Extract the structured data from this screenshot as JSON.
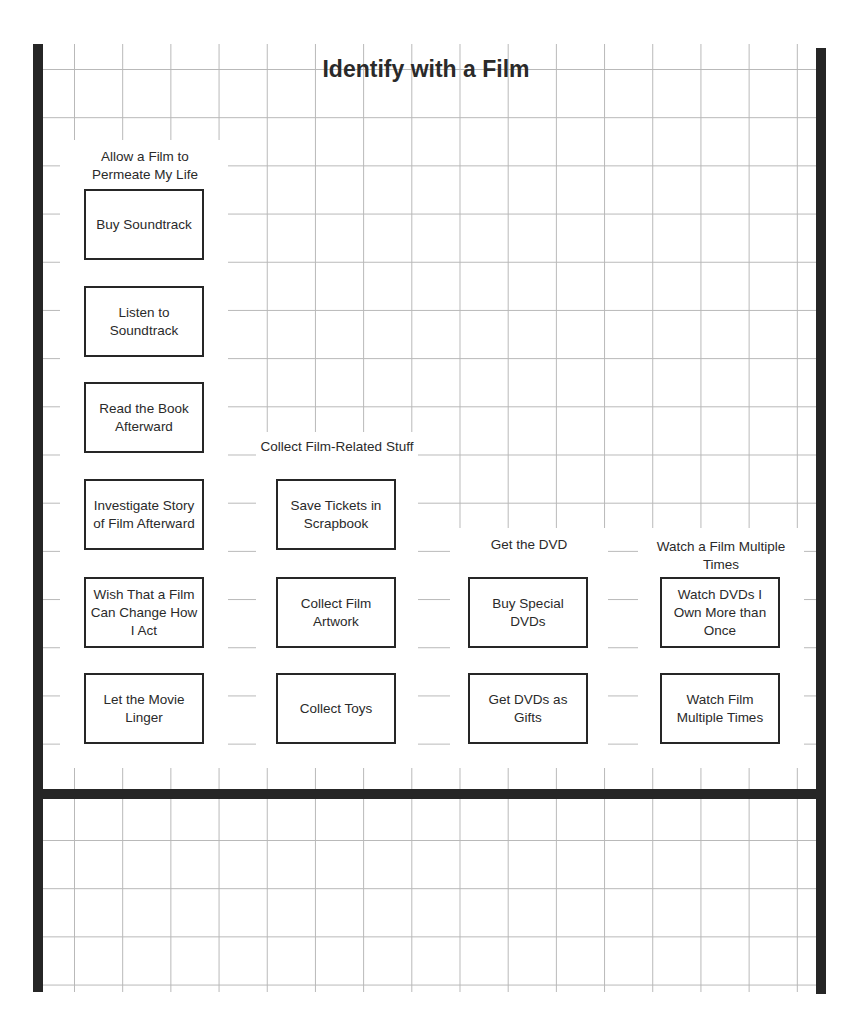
{
  "title": "Identify with a Film",
  "groups": [
    {
      "label": "Allow a Film to Permeate My Life",
      "items": [
        "Buy Soundtrack",
        "Listen to Soundtrack",
        "Read the Book Afterward",
        "Investigate Story of Film Afterward",
        "Wish That a Film Can Change How I Act",
        "Let the Movie Linger"
      ]
    },
    {
      "label": "Collect Film-Related Stuff",
      "items": [
        "Save Tickets in Scrapbook",
        "Collect Film Artwork",
        "Collect Toys"
      ]
    },
    {
      "label": "Get the DVD",
      "items": [
        "Buy Special DVDs",
        "Get DVDs as Gifts"
      ]
    },
    {
      "label": "Watch a Film Multiple Times",
      "items": [
        "Watch DVDs I Own More than Once",
        "Watch Film Multiple Times"
      ]
    }
  ]
}
